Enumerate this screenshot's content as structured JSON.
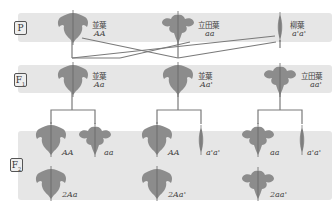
{
  "diagram": {
    "topic": "leaf shape inheritance (multiple alleles)",
    "colors": {
      "band": "#e6e6e6",
      "leaf": "#8c8c8c",
      "line": "#777777"
    },
    "generations": [
      {
        "id": "P",
        "label": "P",
        "sub": ""
      },
      {
        "id": "F1",
        "label": "F",
        "sub": "1"
      },
      {
        "id": "F2",
        "label": "F",
        "sub": "2"
      }
    ],
    "P": [
      {
        "phenotype": "並葉",
        "genotype": "AA",
        "leaf": "normal"
      },
      {
        "phenotype": "立田葉",
        "genotype": "aa",
        "leaf": "tatsuta"
      },
      {
        "phenotype": "柳葉",
        "genotype": "a'a'",
        "leaf": "willow"
      }
    ],
    "F1": [
      {
        "phenotype": "並葉",
        "genotype": "Aa",
        "leaf": "normal"
      },
      {
        "phenotype": "並葉",
        "genotype": "Aa'",
        "leaf": "normal"
      },
      {
        "phenotype": "立田葉",
        "genotype": "aa'",
        "leaf": "tatsuta"
      }
    ],
    "F2": [
      {
        "group": 1,
        "items": [
          {
            "genotype": "AA",
            "leaf": "normal"
          },
          {
            "genotype": "aa",
            "leaf": "tatsuta"
          },
          {
            "genotype": "2Aa",
            "leaf": "normal"
          }
        ]
      },
      {
        "group": 2,
        "items": [
          {
            "genotype": "AA",
            "leaf": "normal"
          },
          {
            "genotype": "a'a'",
            "leaf": "willow"
          },
          {
            "genotype": "2Aa'",
            "leaf": "normal"
          }
        ]
      },
      {
        "group": 3,
        "items": [
          {
            "genotype": "aa",
            "leaf": "tatsuta"
          },
          {
            "genotype": "a'a'",
            "leaf": "willow"
          },
          {
            "genotype": "2aa'",
            "leaf": "tatsuta"
          }
        ]
      }
    ]
  }
}
